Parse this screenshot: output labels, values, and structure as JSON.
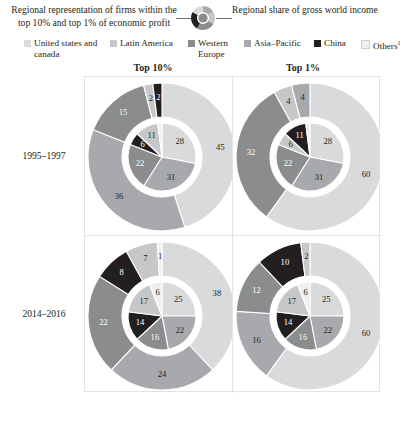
{
  "header": {
    "left_caption": "Regional representation of firms within the top 10% and top 1% of economic profit",
    "right_caption": "Regional share of gross world income",
    "marker_icon": "donut-chart-icon"
  },
  "legend": {
    "items": [
      {
        "label": "United states and canada",
        "color": "#d9dadb"
      },
      {
        "label": "Latin America",
        "color": "#c6c7c9"
      },
      {
        "label": "Western Europe",
        "color": "#8a8c8e"
      },
      {
        "label": "Asia–Pacific",
        "color": "#a7a9ac"
      },
      {
        "label": "China",
        "color": "#231f20"
      },
      {
        "label": "Others",
        "color": "#eeeeee",
        "superscript": "1"
      }
    ]
  },
  "columns": [
    {
      "id": "top10",
      "label": "Top 10%"
    },
    {
      "id": "top1",
      "label": "Top 1%"
    }
  ],
  "rows": [
    {
      "id": "p1995",
      "label": "1995–1997"
    },
    {
      "id": "p2014",
      "label": "2014–2016"
    }
  ],
  "chart_data": {
    "type": "pie",
    "legend_position": "top",
    "series_names": [
      "United states and canada",
      "Latin America",
      "Western Europe",
      "Asia–Pacific",
      "China",
      "Others"
    ],
    "colors": [
      "#d9dadb",
      "#c6c7c9",
      "#8a8c8e",
      "#a7a9ac",
      "#231f20",
      "#eeeeee"
    ],
    "units": "percent",
    "panels": [
      {
        "row": "1995–1997",
        "column": "Top 10%",
        "inner": {
          "name": "Regional representation of firms within the top 10% of economic profit",
          "categories": [
            "United states and canada",
            "Asia–Pacific",
            "Western Europe",
            "China",
            "Latin America",
            "Others"
          ],
          "values": [
            28,
            31,
            22,
            6,
            11,
            2
          ],
          "labels": [
            "28",
            "31",
            "22",
            "6",
            "11",
            ""
          ]
        },
        "outer": {
          "name": "Regional share of gross world income",
          "categories": [
            "United states and canada",
            "Asia–Pacific",
            "Western Europe",
            "Latin America",
            "China",
            "Others"
          ],
          "values": [
            45,
            36,
            15,
            2,
            2,
            0
          ],
          "labels": [
            "45",
            "36",
            "15",
            "2",
            "2",
            ""
          ]
        }
      },
      {
        "row": "1995–1997",
        "column": "Top 1%",
        "inner": {
          "name": "Regional representation of firms within the top 1% of economic profit",
          "categories": [
            "United states and canada",
            "Asia–Pacific",
            "Western Europe",
            "Latin America",
            "China",
            "Others"
          ],
          "values": [
            28,
            31,
            22,
            6,
            11,
            2
          ],
          "labels": [
            "28",
            "31",
            "22",
            "6",
            "11",
            ""
          ]
        },
        "outer": {
          "name": "Regional share of gross world income",
          "categories": [
            "United states and canada",
            "Western Europe",
            "Latin America",
            "Asia–Pacific",
            "China",
            "Others"
          ],
          "values": [
            60,
            32,
            4,
            4,
            0,
            0
          ],
          "labels": [
            "60",
            "32",
            "4",
            "4",
            "",
            ""
          ]
        }
      },
      {
        "row": "2014–2016",
        "column": "Top 10%",
        "inner": {
          "name": "Regional representation of firms within the top 10% of economic profit",
          "categories": [
            "United states and canada",
            "Asia–Pacific",
            "Western Europe",
            "China",
            "Latin America",
            "Others"
          ],
          "values": [
            25,
            22,
            16,
            14,
            17,
            6
          ],
          "labels": [
            "25",
            "22",
            "16",
            "14",
            "17",
            "6"
          ]
        },
        "outer": {
          "name": "Regional share of gross world income",
          "categories": [
            "United states and canada",
            "Asia–Pacific",
            "Western Europe",
            "China",
            "Latin America",
            "Others"
          ],
          "values": [
            38,
            24,
            22,
            8,
            7,
            1
          ],
          "labels": [
            "38",
            "24",
            "22",
            "8",
            "7",
            "1"
          ]
        }
      },
      {
        "row": "2014–2016",
        "column": "Top 1%",
        "inner": {
          "name": "Regional representation of firms within the top 1% of economic profit",
          "categories": [
            "United states and canada",
            "Asia–Pacific",
            "Western Europe",
            "China",
            "Latin America",
            "Others"
          ],
          "values": [
            25,
            22,
            16,
            14,
            17,
            6
          ],
          "labels": [
            "25",
            "22",
            "16",
            "14",
            "17",
            "6"
          ]
        },
        "outer": {
          "name": "Regional share of gross world income",
          "categories": [
            "United states and canada",
            "Asia–Pacific",
            "Western Europe",
            "China",
            "Latin America",
            "Others"
          ],
          "values": [
            60,
            16,
            12,
            10,
            2,
            0
          ],
          "labels": [
            "60",
            "16",
            "12",
            "10",
            "2",
            ""
          ]
        }
      }
    ]
  }
}
